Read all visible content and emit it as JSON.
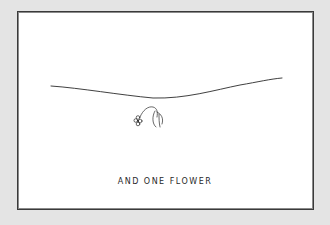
{
  "illustration": {
    "caption": "AND ONE FLOWER",
    "elements": [
      "horizon-line",
      "flower"
    ],
    "colors": {
      "background": "#e4e4e4",
      "paper": "#ffffff",
      "ink": "#2a2a2a"
    }
  }
}
